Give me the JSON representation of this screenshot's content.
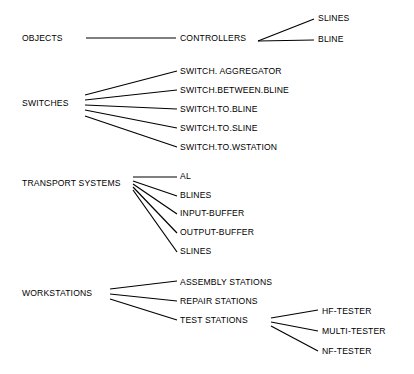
{
  "diagram": {
    "type": "hierarchy-tree",
    "background_color": "#ffffff",
    "line_color": "#000000",
    "text_color": "#000000",
    "groups": [
      {
        "id": "objects",
        "root": {
          "label": "OBJECTS",
          "x": 22,
          "y": 38
        },
        "children": [
          {
            "label": "CONTROLLERS",
            "x": 180,
            "y": 38
          }
        ],
        "grandchildren": [
          {
            "label": "SLINES",
            "x": 318,
            "y": 18
          },
          {
            "label": "BLINE",
            "x": 318,
            "y": 39
          }
        ]
      },
      {
        "id": "switches",
        "root": {
          "label": "SWITCHES",
          "x": 22,
          "y": 103
        },
        "children": [
          {
            "label": "SWITCH. AGGREGATOR",
            "x": 180,
            "y": 71
          },
          {
            "label": "SWITCH.BETWEEN.BLINE",
            "x": 180,
            "y": 90
          },
          {
            "label": "SWITCH.TO.BLINE",
            "x": 180,
            "y": 109
          },
          {
            "label": "SWITCH.TO.SLINE",
            "x": 180,
            "y": 128
          },
          {
            "label": "SWITCH.TO.WSTATION",
            "x": 180,
            "y": 147
          }
        ]
      },
      {
        "id": "transport-systems",
        "root": {
          "label": "TRANSPORT SYSTEMS",
          "x": 22,
          "y": 183
        },
        "children": [
          {
            "label": "AL",
            "x": 180,
            "y": 176
          },
          {
            "label": "BLINES",
            "x": 180,
            "y": 195
          },
          {
            "label": "INPUT-BUFFER",
            "x": 180,
            "y": 213
          },
          {
            "label": "OUTPUT-BUFFER",
            "x": 180,
            "y": 232
          },
          {
            "label": "SLINES",
            "x": 180,
            "y": 251
          }
        ]
      },
      {
        "id": "workstations",
        "root": {
          "label": "WORKSTATIONS",
          "x": 22,
          "y": 293
        },
        "children": [
          {
            "label": "ASSEMBLY STATIONS",
            "x": 180,
            "y": 282
          },
          {
            "label": "REPAIR STATIONS",
            "x": 180,
            "y": 301
          },
          {
            "label": "TEST STATIONS",
            "x": 180,
            "y": 320
          }
        ],
        "grandchildren": [
          {
            "label": "HF-TESTER",
            "x": 322,
            "y": 311
          },
          {
            "label": "MULTI-TESTER",
            "x": 322,
            "y": 331
          },
          {
            "label": "NF-TESTER",
            "x": 322,
            "y": 351
          }
        ]
      }
    ],
    "edges": {
      "objects": [
        {
          "x1": 86,
          "y1": 38,
          "x2": 176,
          "y2": 38
        },
        {
          "x1": 258,
          "y1": 41,
          "x2": 314,
          "y2": 19
        },
        {
          "x1": 258,
          "y1": 41,
          "x2": 314,
          "y2": 40
        }
      ],
      "switches": [
        {
          "x1": 85,
          "y1": 95,
          "x2": 177,
          "y2": 71
        },
        {
          "x1": 85,
          "y1": 100,
          "x2": 177,
          "y2": 90
        },
        {
          "x1": 85,
          "y1": 105,
          "x2": 177,
          "y2": 109
        },
        {
          "x1": 85,
          "y1": 110,
          "x2": 177,
          "y2": 128
        },
        {
          "x1": 85,
          "y1": 116,
          "x2": 177,
          "y2": 147
        }
      ],
      "transport": [
        {
          "x1": 133,
          "y1": 177,
          "x2": 177,
          "y2": 177
        },
        {
          "x1": 133,
          "y1": 181,
          "x2": 177,
          "y2": 196
        },
        {
          "x1": 133,
          "y1": 184,
          "x2": 177,
          "y2": 214
        },
        {
          "x1": 133,
          "y1": 187,
          "x2": 177,
          "y2": 233
        },
        {
          "x1": 133,
          "y1": 190,
          "x2": 177,
          "y2": 252
        }
      ],
      "workstations": [
        {
          "x1": 110,
          "y1": 289,
          "x2": 177,
          "y2": 281
        },
        {
          "x1": 110,
          "y1": 294,
          "x2": 177,
          "y2": 301
        },
        {
          "x1": 110,
          "y1": 299,
          "x2": 177,
          "y2": 320
        },
        {
          "x1": 271,
          "y1": 318,
          "x2": 318,
          "y2": 310
        },
        {
          "x1": 271,
          "y1": 322,
          "x2": 318,
          "y2": 331
        },
        {
          "x1": 271,
          "y1": 326,
          "x2": 318,
          "y2": 351
        }
      ]
    }
  }
}
